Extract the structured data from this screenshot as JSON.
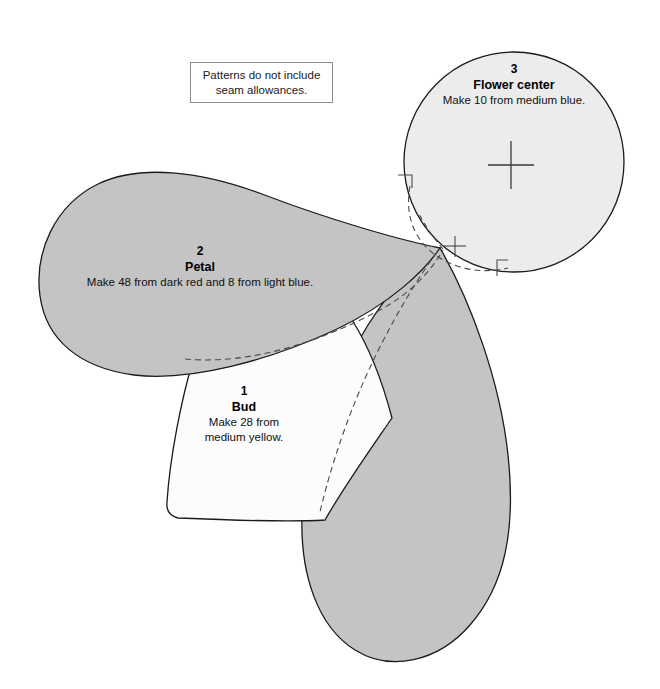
{
  "document": {
    "title": "Flower applique pattern template sheet",
    "background_color": "#ffffff"
  },
  "note": {
    "name": "seam-allowance-note",
    "line1": "Patterns do not include",
    "line2": "seam allowances.",
    "border_color": "#8d8d8d"
  },
  "pieces": [
    {
      "number": "1",
      "name": "Bud",
      "instruction_line1": "Make 28 from",
      "instruction_line2": "medium yellow.",
      "instruction_full": "Make 28 from medium yellow.",
      "quantity": 28,
      "fabric": "medium yellow",
      "fill_color": "#fcfcfc",
      "outline_color": "#1a1a1a"
    },
    {
      "number": "2",
      "name": "Petal",
      "instruction_line1": "Make 48 from dark red and 8 from light blue.",
      "instruction_line2": "",
      "instruction_full": "Make 48 from dark red and 8 from light blue.",
      "quantity": 56,
      "fabric": "dark red and light blue",
      "fill_color": "#c4c4c4",
      "outline_color": "#1a1a1a"
    },
    {
      "number": "3",
      "name": "Flower center",
      "instruction_line1": "Make 10 from medium blue.",
      "instruction_line2": "",
      "instruction_full": "Make 10 from medium blue.",
      "quantity": 10,
      "fabric": "medium blue",
      "fill_color": "#ececec",
      "outline_color": "#1a1a1a"
    }
  ],
  "marks": {
    "center_crosshair": "registration-cross",
    "junction_crosshair": "alignment-cross",
    "seam_line_style": "dashed"
  }
}
